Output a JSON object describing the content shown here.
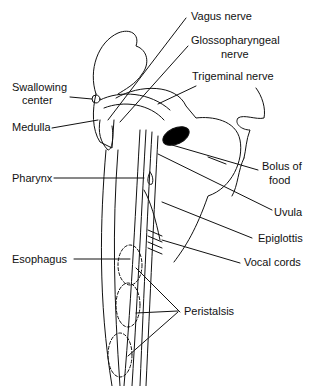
{
  "diagram": {
    "labels": {
      "vagus": "Vagus nerve",
      "glosso_1": "Glossopharyngeal",
      "glosso_2": "nerve",
      "trigeminal": "Trigeminal nerve",
      "swallow_1": "Swallowing",
      "swallow_2": "center",
      "medulla": "Medulla",
      "bolus_1": "Bolus of",
      "bolus_2": "food",
      "pharynx": "Pharynx",
      "uvula": "Uvula",
      "epiglottis": "Epiglottis",
      "esophagus": "Esophagus",
      "vocal": "Vocal cords",
      "peristalsis": "Peristalsis"
    },
    "colors": {
      "line": "#111111",
      "background": "#ffffff",
      "bolus": "#000000"
    }
  }
}
